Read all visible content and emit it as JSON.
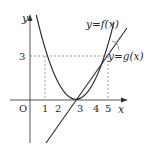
{
  "figure": {
    "axis_labels": {
      "x": "x",
      "y": "y",
      "origin": "O"
    },
    "x_ticks": [
      "1",
      "2",
      "3",
      "4",
      "5"
    ],
    "y_ticks": [
      "3"
    ],
    "curves": [
      {
        "name": "f",
        "label": "y=f(x)",
        "type": "parabola",
        "roots": [
          2,
          4
        ],
        "vertex": [
          3,
          -1
        ]
      },
      {
        "name": "g",
        "label": "y=g(x)",
        "type": "line",
        "points": [
          [
            3,
            0
          ],
          [
            5,
            3
          ]
        ]
      }
    ],
    "guides": {
      "horizontal_at_y": 3,
      "vertical_at_x": [
        1,
        5
      ]
    },
    "colors": {
      "stroke": "#2a2a2a",
      "guide": "#777777",
      "background": "#ffffff"
    }
  }
}
